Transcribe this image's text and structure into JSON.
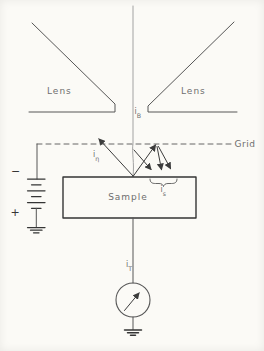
{
  "figure": {
    "colors": {
      "background": "#fbfaf6",
      "line-color": "#565656",
      "beam-color": "#a2a2a2",
      "component-color": "#353535",
      "arrow-color": "#3c3c3c",
      "text-color": "#6e6e6e"
    },
    "labels": {
      "lens_left": "Lens",
      "lens_right": "Lens",
      "grid": "Grid",
      "sample": "Sample",
      "beam_current": {
        "base": "i",
        "sub": "B"
      },
      "backscatter_current": {
        "base": "i",
        "sub": "η"
      },
      "secondary_current": {
        "base": "i",
        "sub": "s"
      },
      "target_current": {
        "base": "i",
        "sub": "T"
      },
      "battery_minus": "−",
      "battery_plus": "+"
    }
  }
}
